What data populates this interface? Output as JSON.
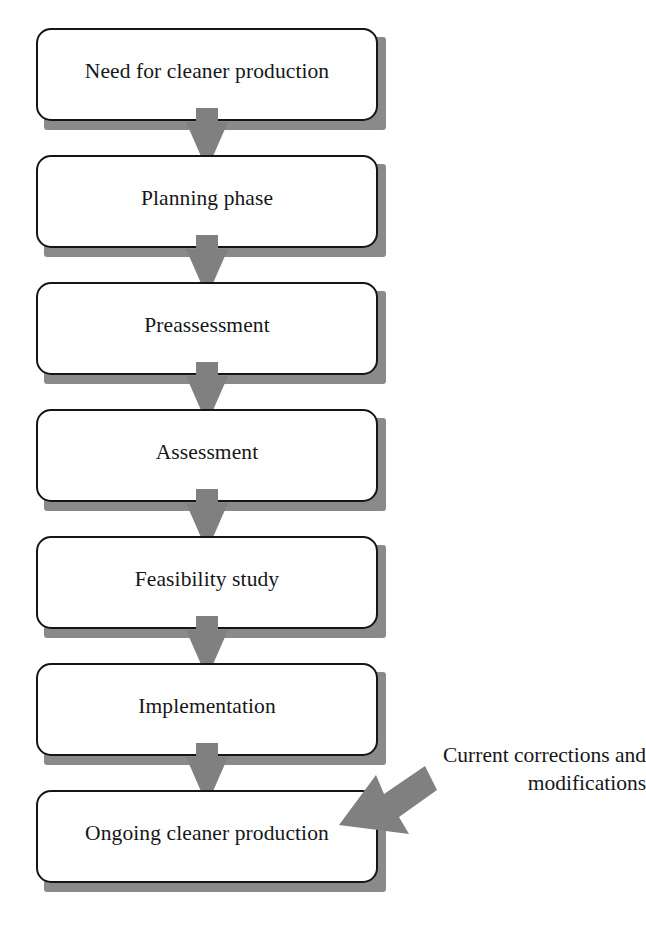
{
  "diagram": {
    "colors": {
      "box_border": "#151515",
      "box_fill": "#ffffff",
      "shadow": "#8a8a8a",
      "arrow": "#808080",
      "text": "#16161a",
      "background": "#ffffff"
    },
    "nodes": [
      {
        "id": "need",
        "label": "Need for cleaner production",
        "top": 28
      },
      {
        "id": "planning",
        "label": "Planning phase",
        "top": 155
      },
      {
        "id": "preassess",
        "label": "Preassessment",
        "top": 282
      },
      {
        "id": "assessment",
        "label": "Assessment",
        "top": 409
      },
      {
        "id": "feasibility",
        "label": "Feasibility study",
        "top": 536
      },
      {
        "id": "implement",
        "label": "Implementation",
        "top": 663
      },
      {
        "id": "ongoing",
        "label": "Ongoing cleaner production",
        "top": 790
      }
    ],
    "connectors": [
      {
        "id": "need-to-planning",
        "from": "need",
        "to": "planning",
        "top": 108
      },
      {
        "id": "planning-to-preassessment",
        "from": "planning",
        "to": "preassess",
        "top": 235
      },
      {
        "id": "preassessment-to-assessment",
        "from": "preassess",
        "to": "assessment",
        "top": 362
      },
      {
        "id": "assessment-to-feasibility",
        "from": "assessment",
        "to": "feasibility",
        "top": 489
      },
      {
        "id": "feasibility-to-implementation",
        "from": "feasibility",
        "to": "implement",
        "top": 616
      },
      {
        "id": "implementation-to-ongoing",
        "from": "implement",
        "to": "ongoing",
        "top": 743
      }
    ],
    "feedback": {
      "label_line1": "Current corrections and",
      "label_line2": "modifications",
      "target": "ongoing"
    }
  }
}
